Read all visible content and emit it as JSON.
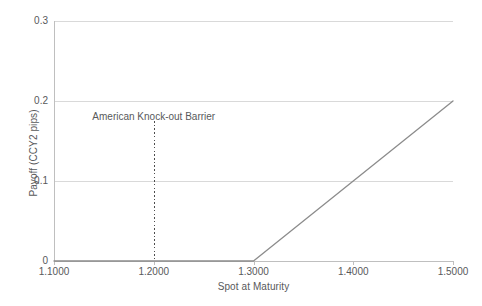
{
  "chart_data": {
    "type": "line",
    "title": "",
    "xlabel": "Spot at Maturity",
    "ylabel": "Payoff (CCY2 pips)",
    "xlim": [
      1.1,
      1.5
    ],
    "ylim": [
      0,
      0.3
    ],
    "grid": true,
    "legend": "none",
    "x_ticks": [
      {
        "value": 1.1,
        "label": "1.1000"
      },
      {
        "value": 1.2,
        "label": "1.2000"
      },
      {
        "value": 1.3,
        "label": "1.3000"
      },
      {
        "value": 1.4,
        "label": "1.4000"
      },
      {
        "value": 1.5,
        "label": "1.5000"
      }
    ],
    "y_ticks": [
      {
        "value": 0,
        "label": "0"
      },
      {
        "value": 0.1,
        "label": "0.1"
      },
      {
        "value": 0.2,
        "label": "0.2"
      },
      {
        "value": 0.3,
        "label": "0.3"
      }
    ],
    "series": [
      {
        "name": "Payoff",
        "color": "#8c8c8c",
        "x": [
          1.1,
          1.2,
          1.3,
          1.4,
          1.5
        ],
        "values": [
          0,
          0,
          0,
          0.1,
          0.2
        ]
      }
    ],
    "annotations": [
      {
        "name": "american-knock-out-barrier",
        "text": "American Knock-out Barrier",
        "x": 1.2,
        "line_style": "dotted",
        "line_color": "#4d4d4d",
        "line_from_y": 0.175,
        "line_to_y": 0
      }
    ],
    "colors": {
      "background": "#ffffff",
      "grid": "#d9d9d9",
      "axis": "#bfbfbf",
      "text": "#58595b",
      "series": "#8c8c8c",
      "barrier": "#4d4d4d"
    }
  }
}
